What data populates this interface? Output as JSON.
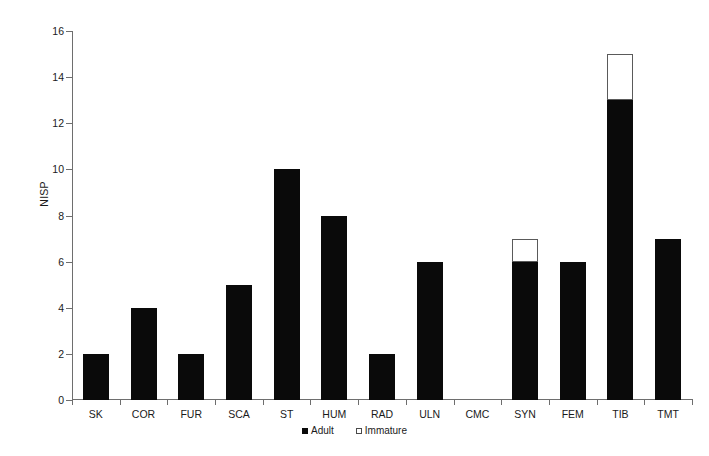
{
  "chart_data": {
    "type": "bar",
    "title": "",
    "subtitle": "",
    "xlabel": "",
    "ylabel": "NISP",
    "ylim": [
      0,
      16
    ],
    "ytick_step": 2,
    "yticks": [
      0,
      2,
      4,
      6,
      8,
      10,
      12,
      14,
      16
    ],
    "grid": false,
    "stacked": true,
    "legend_position": "bottom-center",
    "categories": [
      "SK",
      "COR",
      "FUR",
      "SCA",
      "ST",
      "HUM",
      "RAD",
      "ULN",
      "CMC",
      "SYN",
      "FEM",
      "TIB",
      "TMT"
    ],
    "series": [
      {
        "name": "Adult",
        "color": "#0a0a0a",
        "values": [
          2,
          4,
          2,
          5,
          10,
          8,
          2,
          6,
          0,
          6,
          6,
          13,
          7
        ]
      },
      {
        "name": "Immature",
        "color": "#ffffff",
        "values": [
          0,
          0,
          0,
          0,
          0,
          0,
          0,
          0,
          0,
          1,
          0,
          2,
          0
        ]
      }
    ],
    "totals": [
      2,
      4,
      2,
      5,
      10,
      8,
      2,
      6,
      0,
      7,
      6,
      15,
      7
    ]
  },
  "legend": {
    "entries": [
      {
        "label": "Adult",
        "swatch": "filled-square-icon"
      },
      {
        "label": "Immature",
        "swatch": "open-square-icon"
      }
    ]
  },
  "axis": {
    "y_title": "NISP"
  }
}
